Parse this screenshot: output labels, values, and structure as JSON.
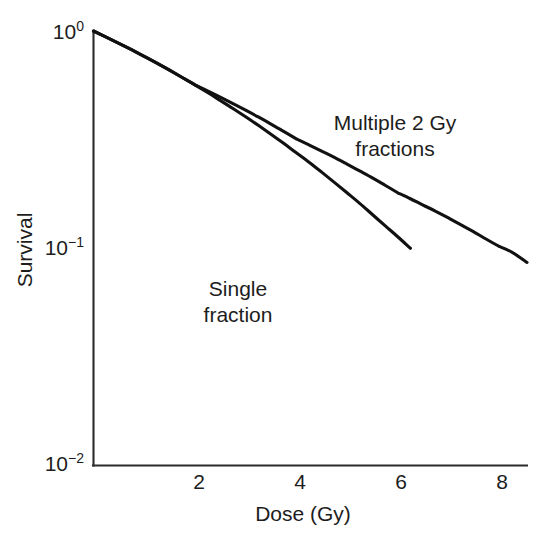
{
  "chart_data": {
    "type": "line",
    "title": "",
    "xlabel": "Dose (Gy)",
    "ylabel": "Survival",
    "xlim": [
      0,
      8.55
    ],
    "ylim": [
      0.01,
      1.0
    ],
    "yscale": "log",
    "xscale": "linear",
    "grid": false,
    "legend_position": "inline-annotations",
    "x_ticks": [
      2,
      4,
      6,
      8
    ],
    "x_tick_labels": [
      "2",
      "4",
      "6",
      "8"
    ],
    "y_ticks": [
      1,
      0.1,
      0.01
    ],
    "y_tick_labels": [
      "10⁰",
      "10⁻¹",
      "10⁻²"
    ],
    "y_tick_label_parts": [
      {
        "base": "10",
        "exp": "0"
      },
      {
        "base": "10",
        "exp": "−1"
      },
      {
        "base": "10",
        "exp": "−2"
      }
    ],
    "model": {
      "name": "linear-quadratic",
      "alpha": 0.25,
      "beta": 0.035,
      "fraction_size_gy": 2
    },
    "series": [
      {
        "name": "Single fraction",
        "annotation_lines": [
          "Single",
          "fraction"
        ],
        "color": "#111111",
        "x": [
          0.0,
          0.25,
          0.5,
          0.75,
          1.0,
          1.25,
          1.5,
          1.75,
          2.0,
          2.25,
          2.5,
          2.75,
          3.0,
          3.25,
          3.5,
          3.75,
          4.0,
          4.25,
          4.5,
          4.75,
          5.0,
          5.25,
          5.5,
          5.75,
          6.0,
          6.25
        ],
        "y": [
          1.0,
          0.938,
          0.878,
          0.82,
          0.764,
          0.711,
          0.66,
          0.611,
          0.565,
          0.521,
          0.479,
          0.44,
          0.403,
          0.368,
          0.335,
          0.304,
          0.275,
          0.249,
          0.224,
          0.201,
          0.18,
          0.161,
          0.143,
          0.127,
          0.113,
          0.1
        ]
      },
      {
        "name": "Multiple 2 Gy fractions",
        "annotation_lines": [
          "Multiple 2 Gy",
          "fractions"
        ],
        "color": "#111111",
        "description": "Effective survival curve for repeated 2 Gy fractions; the shoulder of the single-dose curve is repeated for each fraction, producing a scalloped curve that is shallower overall.",
        "fraction_endpoints_x": [
          2,
          4,
          6,
          8
        ],
        "fraction_endpoints_y": [
          0.565,
          0.319,
          0.18,
          0.102
        ],
        "x": [
          0.0,
          0.25,
          0.5,
          0.75,
          1.0,
          1.25,
          1.5,
          1.75,
          2.0,
          2.0,
          2.25,
          2.5,
          2.75,
          3.0,
          3.25,
          3.5,
          3.75,
          4.0,
          4.0,
          4.25,
          4.5,
          4.75,
          5.0,
          5.25,
          5.5,
          5.75,
          6.0,
          6.0,
          6.25,
          6.5,
          6.75,
          7.0,
          7.25,
          7.5,
          7.75,
          8.0,
          8.0,
          8.25,
          8.55
        ],
        "y": [
          1.0,
          0.938,
          0.878,
          0.82,
          0.764,
          0.711,
          0.66,
          0.611,
          0.565,
          0.565,
          0.53,
          0.496,
          0.463,
          0.432,
          0.402,
          0.373,
          0.345,
          0.319,
          0.319,
          0.299,
          0.28,
          0.262,
          0.244,
          0.227,
          0.211,
          0.195,
          0.18,
          0.18,
          0.169,
          0.158,
          0.148,
          0.138,
          0.128,
          0.119,
          0.11,
          0.102,
          0.102,
          0.096,
          0.086
        ]
      }
    ],
    "annotations": [
      {
        "name": "multiple-fractions-label",
        "text": "Multiple 2 Gy fractions",
        "x_gy": 5.6,
        "y_survival": 0.46
      },
      {
        "name": "single-fraction-label",
        "text": "Single fraction",
        "x_gy": 2.9,
        "y_survival": 0.055
      }
    ]
  },
  "axes": {
    "x": {
      "title": "Dose (Gy)",
      "ticks": [
        {
          "label": "2",
          "value": 2
        },
        {
          "label": "4",
          "value": 4
        },
        {
          "label": "6",
          "value": 6
        },
        {
          "label": "8",
          "value": 8
        }
      ]
    },
    "y": {
      "title": "Survival",
      "ticks": [
        {
          "base": "10",
          "exp": "0",
          "value": 1
        },
        {
          "base": "10",
          "exp": "−1",
          "value": 0.1
        },
        {
          "base": "10",
          "exp": "−2",
          "value": 0.01
        }
      ]
    }
  },
  "labels": {
    "multiple_line1": "Multiple 2 Gy",
    "multiple_line2": "fractions",
    "single_line1": "Single",
    "single_line2": "fraction",
    "y_axis_title": "Survival",
    "x_axis_title": "Dose (Gy)",
    "tick_x_1": "2",
    "tick_x_2": "4",
    "tick_x_3": "6",
    "tick_x_4": "8",
    "tick_y_1_base": "10",
    "tick_y_1_exp": "0",
    "tick_y_2_base": "10",
    "tick_y_2_exp": "−1",
    "tick_y_3_base": "10",
    "tick_y_3_exp": "−2"
  },
  "colors": {
    "curve": "#111111",
    "axis": "#2b2b2b",
    "text": "#1d1d1d",
    "background": "#ffffff"
  }
}
